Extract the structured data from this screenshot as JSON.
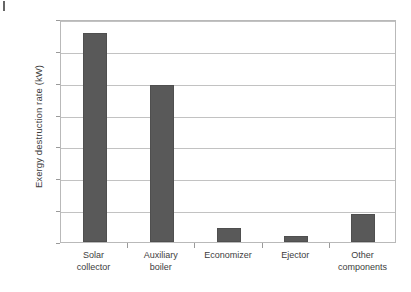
{
  "page": {
    "artifact_name": "page-edge-mark"
  },
  "chart_data": {
    "type": "bar",
    "title": "",
    "xlabel": "",
    "ylabel": "Exergy destruction rate (kW)",
    "categories": [
      "Solar collector",
      "Auxiliary boiler",
      "Economizer",
      "Ejector",
      "Other components"
    ],
    "category_lines": [
      [
        "Solar",
        "collector"
      ],
      [
        "Auxiliary",
        "boiler"
      ],
      [
        "Economizer",
        ""
      ],
      [
        "Ejector",
        ""
      ],
      [
        "Other",
        "components"
      ]
    ],
    "values": [
      13.1,
      9.85,
      0.9,
      0.4,
      1.75
    ],
    "ylim": [
      0,
      14
    ],
    "yticks": [
      0,
      2,
      4,
      6,
      8,
      10,
      12,
      14
    ],
    "ytick_labels": [
      "0",
      "2",
      "4",
      "6",
      "8",
      "10",
      "12",
      "14"
    ],
    "grid": "horizontal",
    "legend": "none",
    "bar_color": "#595959",
    "grid_color": "#c2c2c2",
    "axis_color": "#b9b9b9"
  }
}
